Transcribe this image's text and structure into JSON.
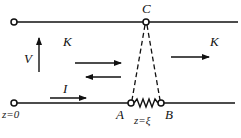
{
  "diagram": {
    "type": "transmission-line-circuit",
    "colors": {
      "stroke": "#111111",
      "background": "#ffffff"
    },
    "nodes": {
      "C": {
        "label": "C"
      },
      "A": {
        "label": "A"
      },
      "B": {
        "label": "B"
      }
    },
    "labels": {
      "voltage": "V",
      "current": "I",
      "wave_left": "K",
      "wave_right": "K",
      "origin": "z=0",
      "load_position": "z=ξ"
    },
    "elements": [
      {
        "kind": "conductor",
        "name": "upper-line"
      },
      {
        "kind": "conductor",
        "name": "lower-line"
      },
      {
        "kind": "resistor",
        "between": [
          "A",
          "B"
        ]
      },
      {
        "kind": "dashed-connection",
        "from": "C",
        "to": "A"
      },
      {
        "kind": "dashed-connection",
        "from": "C",
        "to": "B"
      }
    ],
    "arrows": [
      {
        "name": "voltage-arrow",
        "direction": "up"
      },
      {
        "name": "incident-wave-arrow",
        "direction": "right"
      },
      {
        "name": "reflected-wave-arrow",
        "direction": "left"
      },
      {
        "name": "transmitted-wave-arrow",
        "direction": "right"
      },
      {
        "name": "current-arrow",
        "direction": "right"
      }
    ]
  }
}
